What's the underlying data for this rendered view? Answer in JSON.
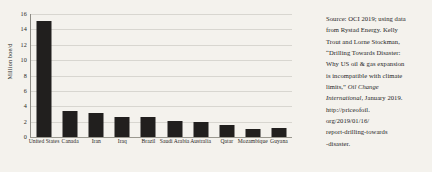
{
  "chart_data": {
    "type": "bar",
    "title": "",
    "subtitle": "",
    "xlabel": "",
    "ylabel": "Million boe/d",
    "ylim": [
      0,
      16
    ],
    "ytick_labels": [
      "0",
      "2",
      "4",
      "6",
      "8",
      "10",
      "12",
      "14",
      "16"
    ],
    "ytick_values": [
      0,
      2,
      4,
      6,
      8,
      10,
      12,
      14,
      16
    ],
    "grid": true,
    "legend": "none",
    "bar_color": "#211f1e",
    "grid_color": "#d8d6d0",
    "categories": [
      "United States",
      "Canada",
      "Iran",
      "Iraq",
      "Brazil",
      "Saudi Arabia",
      "Australia",
      "Qatar",
      "Mozambique",
      "Guyana"
    ],
    "values": [
      15.1,
      3.4,
      3.1,
      2.6,
      2.6,
      2.1,
      1.9,
      1.5,
      1.1,
      1.2
    ]
  },
  "source_note": {
    "line1": "Source: OCI 2019; using data",
    "line2": "from Rystad Energy. Kelly",
    "line3": "Trout and Lorne Stockman,",
    "line4": "“Drilling Towards Disaster:",
    "line5": "Why US oil & gas expansion",
    "line6": "is incompatible with climate",
    "line7_plain": "limits,” ",
    "line7_italic": "Oil Change",
    "line8_italic": "International",
    "line8_plain": ", January 2019.",
    "line9": "http://priceofoil.",
    "line10": "org/2019/01/16/",
    "line11": "report-drilling-towards",
    "line12": "-disaster."
  },
  "colors": {
    "background": "#f4f2ed",
    "bar": "#211f1e",
    "gridline": "#d8d6d0",
    "axis": "#8e8c85",
    "text": "#26251f"
  }
}
